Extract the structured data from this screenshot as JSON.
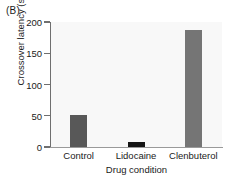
{
  "figure": {
    "panel_label": "(B)",
    "background_color": "#ffffff",
    "plot_background_color": "#f8f8f8",
    "axis_color": "#6f6f6f"
  },
  "chart_data": {
    "type": "bar",
    "title": "",
    "panel": "(B)",
    "categories": [
      "Control",
      "Lidocaine",
      "Clenbuterol"
    ],
    "values": [
      52,
      8,
      187
    ],
    "bar_colors": [
      "#585858",
      "#151515",
      "#757575"
    ],
    "xlabel": "Drug condition",
    "ylabel": "Crossover latency (s)",
    "ylim": [
      0,
      200
    ],
    "yticks": [
      0,
      50,
      100,
      150,
      200
    ],
    "ytick_labels": [
      "0",
      "50",
      "100",
      "150",
      "200"
    ],
    "grid": false,
    "legend": false,
    "legend_position": "none"
  }
}
